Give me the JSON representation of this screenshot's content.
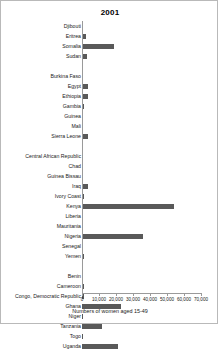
{
  "chart_data": {
    "type": "bar",
    "orientation": "horizontal",
    "title": "2001",
    "xlabel": "Numbers of women aged 15-49",
    "ylabel": "",
    "xlim": [
      0,
      70000
    ],
    "xticks": [
      0,
      10000,
      20000,
      30000,
      40000,
      50000,
      60000,
      70000
    ],
    "xtick_labels": [
      "0",
      "10,000",
      "20,000",
      "30,000",
      "40,000",
      "50,000",
      "60,000",
      "70,000"
    ],
    "grid": false,
    "legend": false,
    "bar_color": "#595959",
    "categories": [
      "Djibouti",
      "Eritrea",
      "Somalia",
      "Sudan",
      "",
      "Burkina Faso",
      "Egypt",
      "Ethiopia",
      "Gambia",
      "Guinea",
      "Mali",
      "Sierra Leone",
      "",
      "Central African Republic",
      "Chad",
      "Guinea Bissau",
      "Iraq",
      "Ivory Coast",
      "Kenya",
      "Liberia",
      "Mauritania",
      "Nigeria",
      "Senegal",
      "Yemen",
      "",
      "Benin",
      "Cameroon",
      "Congo, Democratic Republic",
      "Ghana",
      "Niger",
      "Tanzania",
      "Togo",
      "Uganda"
    ],
    "values": [
      300,
      2600,
      19000,
      2700,
      0,
      200,
      3600,
      3500,
      1100,
      200,
      200,
      3400,
      0,
      300,
      200,
      300,
      3700,
      900,
      54000,
      800,
      300,
      36000,
      200,
      1200,
      0,
      300,
      1100,
      1200,
      23000,
      400,
      12000,
      200,
      21000
    ]
  }
}
